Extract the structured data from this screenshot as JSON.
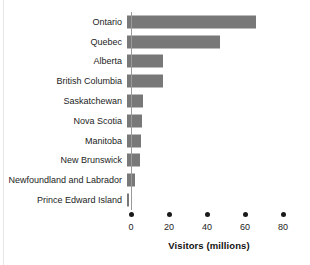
{
  "figure": {
    "title": "",
    "background": "#ffffff",
    "edge_rule_color": "#e6e6e6"
  },
  "axis": {
    "title": "Visitors (millions)",
    "tick_values": [
      0,
      20,
      40,
      60,
      80
    ],
    "tick_labels": [
      "0",
      "20",
      "40",
      "60",
      "80"
    ],
    "tick_marker": "dot-marker",
    "spine_color": "#9a9a9a"
  },
  "chart_data": {
    "type": "bar",
    "orientation": "horizontal",
    "title": "",
    "xlabel": "Visitors (millions)",
    "ylabel": "",
    "xlim": [
      0,
      80
    ],
    "xticks": [
      0,
      20,
      40,
      60,
      80
    ],
    "grid": false,
    "legend": false,
    "bar_color": "#787878",
    "categories": [
      "Ontario",
      "Quebec",
      "Alberta",
      "British Columbia",
      "Saskatchewan",
      "Nova Scotia",
      "Manitoba",
      "New Brunswick",
      "Newfoundland and Labrador",
      "Prince Edward Island"
    ],
    "values": [
      68,
      49,
      19,
      19,
      8.5,
      8,
      7.5,
      7,
      4,
      1
    ],
    "series": [
      {
        "name": "Visitors (millions)",
        "values": [
          68,
          49,
          19,
          19,
          8.5,
          8,
          7.5,
          7,
          4,
          1
        ]
      }
    ]
  }
}
